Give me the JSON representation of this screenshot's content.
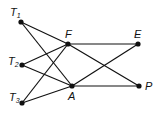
{
  "diagram": {
    "nodes": [
      {
        "id": "T1",
        "label": "T",
        "sub": "1",
        "x": 21,
        "y": 22,
        "lx": 10,
        "ly": 16
      },
      {
        "id": "T2",
        "label": "T",
        "sub": "2",
        "x": 22,
        "y": 65,
        "lx": 8,
        "ly": 65
      },
      {
        "id": "T3",
        "label": "T",
        "sub": "3",
        "x": 22,
        "y": 103,
        "lx": 9,
        "ly": 101
      },
      {
        "id": "F",
        "label": "F",
        "sub": "",
        "x": 68,
        "y": 44,
        "lx": 65,
        "ly": 38
      },
      {
        "id": "A",
        "label": "A",
        "sub": "",
        "x": 72,
        "y": 86,
        "lx": 68,
        "ly": 100
      },
      {
        "id": "E",
        "label": "E",
        "sub": "",
        "x": 138,
        "y": 44,
        "lx": 134,
        "ly": 38
      },
      {
        "id": "P",
        "label": "P",
        "sub": "",
        "x": 139,
        "y": 86,
        "lx": 145,
        "ly": 90
      }
    ],
    "edges": [
      [
        "T1",
        "F"
      ],
      [
        "T1",
        "A"
      ],
      [
        "T2",
        "F"
      ],
      [
        "T2",
        "A"
      ],
      [
        "T3",
        "F"
      ],
      [
        "T3",
        "A"
      ],
      [
        "F",
        "E"
      ],
      [
        "F",
        "P"
      ],
      [
        "A",
        "E"
      ],
      [
        "A",
        "P"
      ]
    ]
  }
}
